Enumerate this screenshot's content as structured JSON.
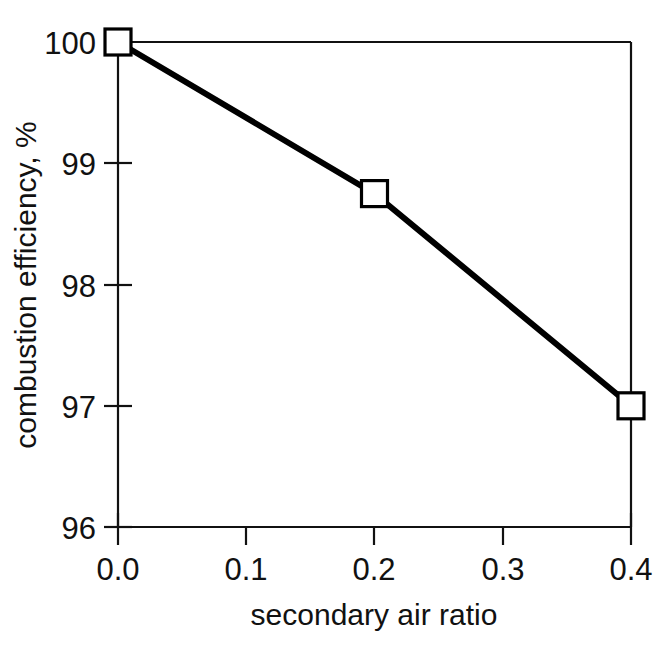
{
  "figure": {
    "background_color": "#ffffff",
    "foreground_color": "#111111"
  },
  "chart_data": {
    "type": "line",
    "title": "",
    "xlabel": "secondary air ratio",
    "ylabel": "combustion efficiency, %",
    "x": [
      0.0,
      0.2,
      0.4
    ],
    "values": [
      100.0,
      98.75,
      97.0
    ],
    "series": [
      {
        "name": "combustion efficiency",
        "x": [
          0.0,
          0.2,
          0.4
        ],
        "values": [
          100.0,
          98.75,
          97.0
        ],
        "marker": "open-square",
        "line_color": "#000000",
        "marker_face_color": "#ffffff",
        "marker_edge_color": "#000000"
      }
    ],
    "xlim": [
      0.0,
      0.4
    ],
    "ylim": [
      96,
      100
    ],
    "xticks": [
      0.0,
      0.1,
      0.2,
      0.3,
      0.4
    ],
    "yticks": [
      96,
      97,
      98,
      99,
      100
    ],
    "xticklabels": [
      "0.0",
      "0.1",
      "0.2",
      "0.3",
      "0.4"
    ],
    "yticklabels": [
      "96",
      "97",
      "98",
      "99",
      "100"
    ],
    "grid": false,
    "legend": null,
    "legend_position": "none",
    "annotations": []
  },
  "axes": {
    "y_tick_labels": [
      {
        "text": "100",
        "value": 100
      },
      {
        "text": "99",
        "value": 99
      },
      {
        "text": "98",
        "value": 98
      },
      {
        "text": "97",
        "value": 97
      },
      {
        "text": "96",
        "value": 96
      }
    ],
    "x_tick_labels": [
      {
        "text": "0.0",
        "value": 0.0
      },
      {
        "text": "0.1",
        "value": 0.1
      },
      {
        "text": "0.2",
        "value": 0.2
      },
      {
        "text": "0.3",
        "value": 0.3
      },
      {
        "text": "0.4",
        "value": 0.4
      }
    ],
    "x_axis_title": "secondary air ratio",
    "y_axis_title": "combustion efficiency, %"
  }
}
